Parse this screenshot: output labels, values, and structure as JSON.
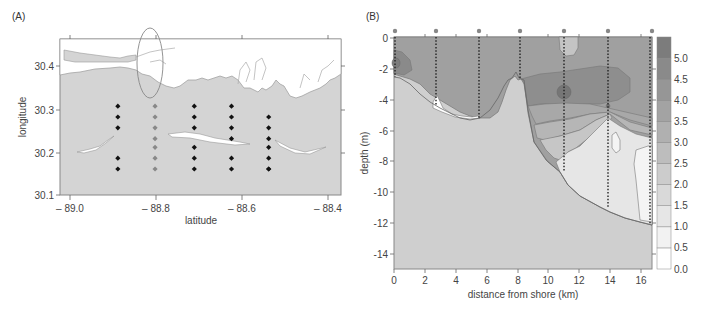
{
  "chart_data": [
    {
      "panel": "(A)",
      "type": "scatter",
      "title": "",
      "xlabel": "latitude",
      "ylabel": "longitude",
      "xlim": [
        -89.05,
        -88.37
      ],
      "ylim": [
        30.1,
        30.46
      ],
      "xticks": [
        "– 89.0",
        "– 88.8",
        "– 88.6",
        "– 88.4"
      ],
      "xtick_values": [
        -89.0,
        -88.8,
        -88.6,
        -88.4
      ],
      "yticks": [
        "30.1",
        "30.2",
        "30.3",
        "30.4"
      ],
      "ytick_values": [
        30.1,
        30.2,
        30.3,
        30.4
      ],
      "grid": false,
      "land_color": "#ffffff",
      "water_color": "#d4d4d4",
      "highlight_ellipse": {
        "cx": -88.81,
        "cy": 30.4,
        "rx": 0.018,
        "ry": 0.065
      },
      "series": [
        {
          "name": "transect 1",
          "color": "#111111",
          "x": [
            -88.91,
            -88.91,
            -88.91,
            -88.91,
            -88.91
          ],
          "y": [
            30.305,
            30.28,
            30.255,
            30.185,
            30.16
          ]
        },
        {
          "name": "transect 2 (highlighted)",
          "color": "#888888",
          "x": [
            -88.82,
            -88.82,
            -88.82,
            -88.82,
            -88.82,
            -88.82,
            -88.82
          ],
          "y": [
            30.305,
            30.28,
            30.255,
            30.23,
            30.21,
            30.185,
            30.16
          ]
        },
        {
          "name": "transect 3",
          "color": "#111111",
          "x": [
            -88.725,
            -88.725,
            -88.725,
            -88.725,
            -88.725,
            -88.725
          ],
          "y": [
            30.305,
            30.28,
            30.255,
            30.21,
            30.185,
            30.16
          ]
        },
        {
          "name": "transect 4",
          "color": "#111111",
          "x": [
            -88.635,
            -88.635,
            -88.635,
            -88.635,
            -88.635,
            -88.635
          ],
          "y": [
            30.305,
            30.28,
            30.255,
            30.23,
            30.185,
            30.16
          ]
        },
        {
          "name": "transect 5",
          "color": "#111111",
          "x": [
            -88.545,
            -88.545,
            -88.545,
            -88.545,
            -88.545,
            -88.545,
            -88.545
          ],
          "y": [
            30.28,
            30.255,
            30.23,
            30.21,
            30.185,
            30.16,
            30.16
          ]
        }
      ]
    },
    {
      "panel": "(B)",
      "type": "heatmap",
      "subtype": "contour",
      "title": "",
      "xlabel": "distance from shore (km)",
      "ylabel": "depth (m)",
      "xlim": [
        0,
        16.7
      ],
      "ylim": [
        -15,
        0
      ],
      "xticks": [
        "0",
        "2",
        "4",
        "6",
        "8",
        "10",
        "12",
        "14",
        "16"
      ],
      "xtick_values": [
        0,
        2,
        4,
        6,
        8,
        10,
        12,
        14,
        16
      ],
      "yticks": [
        "0",
        "-2",
        "-4",
        "-6",
        "-8",
        "-10",
        "-12",
        "-14"
      ],
      "ytick_values": [
        0,
        -2,
        -4,
        -6,
        -8,
        -10,
        -12,
        -14
      ],
      "grid": false,
      "station_x_km": [
        0,
        2.7,
        5.5,
        8.2,
        11.0,
        13.9,
        16.6
      ],
      "station_bottom_depth_m": [
        -2.5,
        -4.5,
        -5.3,
        -2.9,
        -8.7,
        -10.9,
        -12.0
      ],
      "colorbar": {
        "levels": [
          0.0,
          0.5,
          1.0,
          1.5,
          2.0,
          2.5,
          3.0,
          3.5,
          4.0,
          4.5,
          5.0
        ],
        "labels": [
          "5.0",
          "4.5",
          "4.0",
          "3.5",
          "3.0",
          "2.5",
          "2.0",
          "1.5",
          "1.0",
          "0.5",
          "0.0"
        ],
        "colors": [
          "#ffffff",
          "#f2f2f2",
          "#e6e6e6",
          "#d9d9d9",
          "#cccccc",
          "#bdbdbd",
          "#b0b0b0",
          "#a3a3a3",
          "#969696",
          "#8a8a8a",
          "#7c7c7c"
        ],
        "position": "right"
      },
      "bathymetry_km_depth": [
        [
          0,
          -2.6
        ],
        [
          1,
          -3.0
        ],
        [
          2,
          -3.8
        ],
        [
          3,
          -4.5
        ],
        [
          4,
          -5.0
        ],
        [
          5,
          -5.3
        ],
        [
          5.8,
          -5.0
        ],
        [
          6.5,
          -4.0
        ],
        [
          7.0,
          -3.0
        ],
        [
          7.3,
          -2.4
        ],
        [
          7.6,
          -2.8
        ],
        [
          8.2,
          -2.8
        ],
        [
          8.6,
          -4.5
        ],
        [
          9.2,
          -6.5
        ],
        [
          10.2,
          -7.6
        ],
        [
          11.0,
          -8.7
        ],
        [
          12.0,
          -9.7
        ],
        [
          13.0,
          -10.4
        ],
        [
          13.9,
          -10.9
        ],
        [
          15.0,
          -11.4
        ],
        [
          16.7,
          -12.1
        ]
      ],
      "annotations": [
        {
          "note": "high value core (~5.0) near 11 km, -3.5 m"
        },
        {
          "note": "low value (0.0–0.5) pocket near 3–5.5 km, -4 to -5 m"
        }
      ],
      "legend_position": "right"
    }
  ],
  "panels": {
    "a": {
      "label": "(A)",
      "xlabel": "latitude",
      "ylabel": "longitude",
      "xticks": [
        "– 89.0",
        "– 88.8",
        "– 88.6",
        "– 88.4"
      ],
      "yticks": [
        "30.4",
        "30.3",
        "30.2",
        "30.1"
      ]
    },
    "b": {
      "label": "(B)",
      "xlabel": "distance from shore (km)",
      "ylabel": "depth (m)",
      "xticks": [
        "0",
        "2",
        "4",
        "6",
        "8",
        "10",
        "12",
        "14",
        "16"
      ],
      "yticks": [
        "0",
        "-2",
        "-4",
        "-6",
        "-8",
        "-10",
        "-12",
        "-14"
      ],
      "cbar_labels": [
        "5.0",
        "4.5",
        "4.0",
        "3.5",
        "3.0",
        "2.5",
        "2.0",
        "1.5",
        "1.0",
        "0.5",
        "0.0"
      ]
    }
  }
}
